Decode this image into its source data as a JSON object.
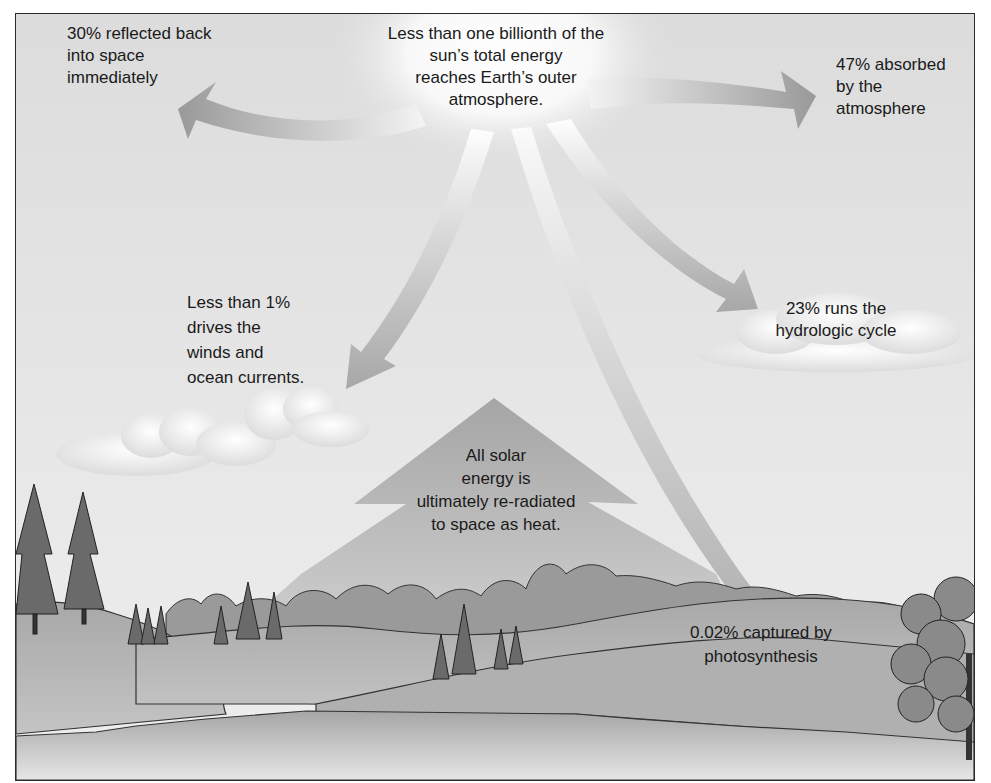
{
  "diagram": {
    "source": {
      "text": "Less than one billionth of the sun’s total energy reaches Earth’s outer atmosphere.",
      "lines": [
        "Less than one billionth of the",
        "sun’s total energy",
        "reaches Earth’s outer",
        "atmosphere."
      ]
    },
    "flows": [
      {
        "id": "reflected",
        "percent": "30%",
        "lines": [
          "30% reflected back",
          "into space",
          "immediately"
        ],
        "direction": "up-left"
      },
      {
        "id": "absorbed",
        "percent": "47%",
        "lines": [
          "47% absorbed",
          "by the",
          "atmosphere"
        ],
        "direction": "right"
      },
      {
        "id": "hydrologic",
        "percent": "23%",
        "lines": [
          "23% runs the",
          "hydrologic cycle"
        ],
        "direction": "down-right"
      },
      {
        "id": "winds",
        "percent": "Less than 1%",
        "lines": [
          "Less than 1%",
          "drives the",
          "winds and",
          "ocean currents."
        ],
        "direction": "down-left"
      },
      {
        "id": "photosynthesis",
        "percent": "0.02%",
        "lines": [
          "0.02% captured by",
          "photosynthesis"
        ],
        "direction": "down"
      },
      {
        "id": "reradiated",
        "percent": "100%",
        "lines": [
          "All solar",
          "energy is",
          "ultimately re-radiated",
          "to space as heat."
        ],
        "direction": "up"
      }
    ],
    "scene_elements": [
      "sun",
      "clouds",
      "hills",
      "conifer-trees",
      "deciduous-tree",
      "forest",
      "lake"
    ],
    "colors": {
      "sky": "#e2e2e2",
      "arrow": "#9a9a9a",
      "sun_glow": "#ffffff",
      "hill_light": "#b5b5b5",
      "hill_dark": "#8a8a8a",
      "water": "#c8c8c8",
      "text": "#1a1a1a",
      "border": "#2a2a2a"
    }
  }
}
